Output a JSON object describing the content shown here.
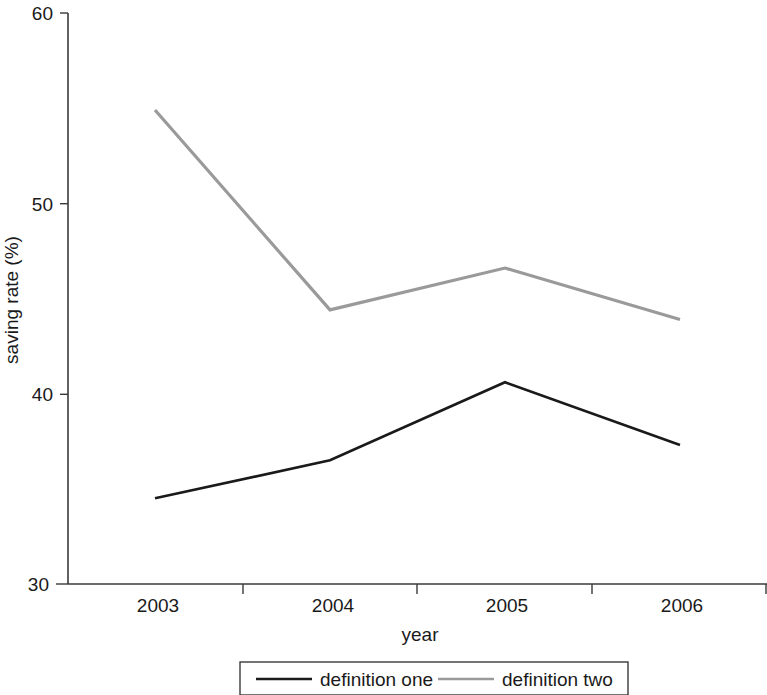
{
  "chart_data": {
    "type": "line",
    "title": "",
    "subtitle": "",
    "xlabel": "year",
    "ylabel": "saving rate (%)",
    "categories": [
      "2003",
      "2004",
      "2005",
      "2006"
    ],
    "x": [
      2003,
      2004,
      2005,
      2006
    ],
    "xlim": [
      2003,
      2006
    ],
    "ylim": [
      30,
      60
    ],
    "yticks": [
      30,
      40,
      50,
      60
    ],
    "ytick_labels": [
      "30",
      "40",
      "50",
      "60"
    ],
    "xtick_labels": [
      "2003",
      "2004",
      "2005",
      "2006"
    ],
    "grid": false,
    "legend_position": "bottom",
    "series": [
      {
        "name": "definition one",
        "color": "#1a1a1a",
        "values": [
          34.5,
          36.5,
          40.6,
          37.3
        ]
      },
      {
        "name": "definition two",
        "color": "#9a9a9a",
        "values": [
          54.9,
          44.4,
          46.6,
          43.9
        ]
      }
    ]
  },
  "axes": {
    "y_title": "saving rate (%)",
    "x_title": "year",
    "y_tick_0": "30",
    "y_tick_1": "40",
    "y_tick_2": "50",
    "y_tick_3": "60",
    "x_tick_0": "2003",
    "x_tick_1": "2004",
    "x_tick_2": "2005",
    "x_tick_3": "2006"
  },
  "legend": {
    "entries": [
      {
        "label": "definition one",
        "color": "#1a1a1a"
      },
      {
        "label": "definition two",
        "color": "#9a9a9a"
      }
    ],
    "entry_0_label": "definition one",
    "entry_1_label": "definition two"
  },
  "colors": {
    "definition_one": "#1a1a1a",
    "definition_two": "#9a9a9a",
    "axis": "#3a3a3a",
    "background": "#ffffff"
  }
}
